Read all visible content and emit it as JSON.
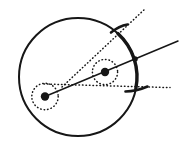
{
  "figure": {
    "background": "#ffffff",
    "ink": "#161616",
    "canvas": {
      "width": 188,
      "height": 154
    },
    "main_circle": {
      "cx": 78,
      "cy": 77,
      "r": 59,
      "stroke_width": 2
    },
    "bold_arc": {
      "start_deg": -47.5,
      "end_deg": 11.5,
      "stroke_width": 3.4
    },
    "centers": [
      {
        "id": "left",
        "x": 45,
        "y": 96.5,
        "dot_r": 4.2,
        "ring_r": 13.2
      },
      {
        "id": "right",
        "x": 105,
        "y": 72,
        "dot_r": 4.2,
        "ring_r": 12.6
      }
    ],
    "solid_line": {
      "x1": 45,
      "y1": 96.5,
      "x2": 178,
      "y2": 41,
      "width": 1.5
    },
    "node": {
      "x": 135,
      "y": 59,
      "r": 2.8
    },
    "dotted_rays": [
      {
        "id": "upper-tangent",
        "x1": 62,
        "y1": 87,
        "x2": 146,
        "y2": 8
      },
      {
        "id": "lower-tangent",
        "x1": 44,
        "y1": 84,
        "x2": 170,
        "y2": 87.6
      }
    ],
    "ticks": [
      {
        "id": "upper",
        "d": "M 111 32.5 Q 119 26 127.5 24.5",
        "width": 2.6
      },
      {
        "id": "lower",
        "d": "M 125.5 91.5 Q 136 91.5 147.5 86.5",
        "width": 2.6
      }
    ],
    "dotted": {
      "dash": "0.5 3",
      "width": 1.5
    }
  }
}
